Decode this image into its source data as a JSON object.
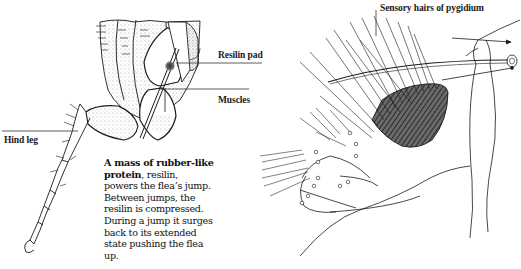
{
  "figure": {
    "panels": [
      {
        "id": "hind-leg-panel",
        "labels": {
          "resilin_pad": "Resilin pad",
          "muscles": "Muscles",
          "hind_leg": "Hind leg"
        },
        "caption": {
          "lead_bold": "A mass of rubber-like protein",
          "rest": ", resilin, powers the flea’s jump. Between jumps, the resilin is compressed. During a jump it surges back to its extended state pushing the flea up."
        }
      },
      {
        "id": "pygidium-panel",
        "labels": {
          "sensory_hairs": "Sensory hairs of pygidium"
        }
      }
    ],
    "colors": {
      "ink": "#1a1a1a",
      "stipple": "#9a9a9a",
      "resilin_pad": "#555555",
      "background": "#ffffff"
    }
  }
}
